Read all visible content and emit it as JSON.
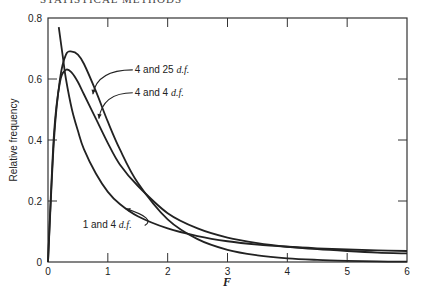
{
  "header": {
    "text": "STATISTICAL METHODS"
  },
  "chart_data": {
    "type": "line",
    "title": "",
    "xlabel": "F",
    "ylabel": "Relative frequency",
    "xlim": [
      0,
      6
    ],
    "ylim": [
      0,
      0.8
    ],
    "xticks": [
      0,
      1,
      2,
      3,
      4,
      5,
      6
    ],
    "yticks": [
      0,
      0.2,
      0.4,
      0.6,
      0.8
    ],
    "ytick_labels": [
      "0",
      "0.2",
      "0.4",
      "0.6",
      "0.8"
    ],
    "grid": false,
    "legend": null,
    "series": [
      {
        "name": "4 and 25 d.f.",
        "x": [
          0,
          0.1,
          0.2,
          0.3,
          0.4,
          0.5,
          0.6,
          0.8,
          1.0,
          1.2,
          1.5,
          2.0,
          2.5,
          3.0,
          3.5,
          4.0,
          4.5,
          5.0,
          5.5,
          6.0
        ],
        "y": [
          0,
          0.4,
          0.6,
          0.68,
          0.69,
          0.68,
          0.65,
          0.56,
          0.46,
          0.37,
          0.26,
          0.14,
          0.075,
          0.04,
          0.022,
          0.012,
          0.007,
          0.004,
          0.002,
          0.001
        ]
      },
      {
        "name": "4 and 4 d.f.",
        "x": [
          0,
          0.1,
          0.2,
          0.3,
          0.4,
          0.5,
          0.6,
          0.8,
          1.0,
          1.2,
          1.5,
          2.0,
          2.5,
          3.0,
          3.5,
          4.0,
          4.5,
          5.0,
          5.5,
          6.0
        ],
        "y": [
          0,
          0.42,
          0.59,
          0.63,
          0.62,
          0.59,
          0.55,
          0.47,
          0.39,
          0.32,
          0.25,
          0.16,
          0.11,
          0.08,
          0.062,
          0.05,
          0.042,
          0.036,
          0.031,
          0.028
        ]
      },
      {
        "name": "1 and 4 d.f.",
        "x": [
          0.18,
          0.25,
          0.3,
          0.4,
          0.5,
          0.6,
          0.8,
          1.0,
          1.2,
          1.5,
          2.0,
          2.5,
          3.0,
          3.5,
          4.0,
          4.5,
          5.0,
          5.5,
          6.0
        ],
        "y": [
          0.77,
          0.67,
          0.6,
          0.5,
          0.43,
          0.37,
          0.29,
          0.23,
          0.19,
          0.15,
          0.11,
          0.085,
          0.068,
          0.057,
          0.05,
          0.045,
          0.041,
          0.038,
          0.036
        ]
      }
    ],
    "annotations": [
      {
        "text": "4 and 25",
        "italic": "d.f.",
        "series": "4 and 25 d.f.",
        "label_at": [
          1.45,
          0.62
        ],
        "arrow_to": [
          0.75,
          0.55
        ]
      },
      {
        "text": "4 and 4",
        "italic": "d.f.",
        "series": "4 and 4 d.f.",
        "label_at": [
          1.45,
          0.545
        ],
        "arrow_to": [
          0.85,
          0.47
        ]
      },
      {
        "text": "1 and 4",
        "italic": "d.f.",
        "series": "1 and 4 d.f.",
        "label_at": [
          0.58,
          0.11
        ],
        "arrow_to": [
          1.3,
          0.175
        ]
      }
    ]
  }
}
